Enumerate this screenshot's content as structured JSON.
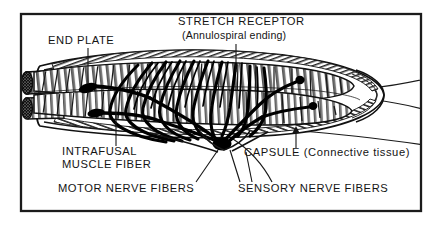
{
  "figure": {
    "title_semantic": "muscle-spindle-anatomy",
    "background_color": "#ffffff",
    "ink_color": "#141414",
    "frame": {
      "present": true,
      "x": 21,
      "y": 14,
      "width": 400,
      "height": 197,
      "stroke_color": "#1b1b1b"
    }
  },
  "labels": {
    "end_plate": {
      "text": "END PLATE",
      "x": 48,
      "y": 44
    },
    "stretch_receptor": {
      "text": "STRETCH RECEPTOR",
      "x": 178,
      "y": 25
    },
    "annulospiral": {
      "text": "(Annulospiral ending)",
      "x": 182,
      "y": 39
    },
    "intrafusal_line1": {
      "text": "INTRAFUSAL",
      "x": 62,
      "y": 155
    },
    "intrafusal_line2": {
      "text": "MUSCLE FIBER",
      "x": 62,
      "y": 168
    },
    "capsule": {
      "text": "CAPSULE (Connective tissue)",
      "x": 244,
      "y": 156
    },
    "motor_nerve_fibers": {
      "text": "MOTOR NERVE FIBERS",
      "x": 58,
      "y": 192
    },
    "sensory_nerve_fibers": {
      "text": "SENSORY NERVE FIBERS",
      "x": 238,
      "y": 192
    }
  },
  "diagram_parts": [
    {
      "name": "capsule-outer-wall",
      "description": "connective tissue capsule, spindle shaped, hatched"
    },
    {
      "name": "intrafusal-muscle-fiber-upper",
      "description": "striated muscle fiber inside capsule"
    },
    {
      "name": "intrafusal-muscle-fiber-lower",
      "description": "striated muscle fiber inside capsule"
    },
    {
      "name": "muscle-fiber-cut-end-upper",
      "description": "stippled cross-section of cut fiber end"
    },
    {
      "name": "muscle-fiber-cut-end-lower",
      "description": "stippled cross-section of cut fiber end"
    },
    {
      "name": "annulospiral-ending",
      "description": "sensory nerve spirals wrapping central fiber region"
    },
    {
      "name": "motor-end-plate-upper",
      "description": "black oval motor end plate on upper fiber"
    },
    {
      "name": "motor-end-plate-lower",
      "description": "black oval motor end plate on lower fiber"
    },
    {
      "name": "nerve-trunk-convergence",
      "description": "nerve fibers converging at bottom center of capsule"
    }
  ],
  "leader_lines": {
    "end_plate": "vertical line from label down to upper motor end plate",
    "stretch_receptor": "vertical line from label down into annulospiral region",
    "intrafusal": "vertical line from lower fiber up to label",
    "capsule": "arrow pointing up to capsule wall",
    "motor_nerve": "diagonal line from label up to nerve convergence",
    "sensory_nerve": "diagonal lines from label up to nerve convergence"
  }
}
